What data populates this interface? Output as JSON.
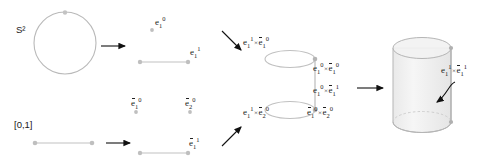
{
  "figure": {
    "domain_labels": {
      "sphere": "S²",
      "interval": "[0,1]"
    },
    "cw_left_top": {
      "vertex_cell": "e₁⁰",
      "edge_cell": "e₁¹"
    },
    "cw_left_bottom": {
      "vertex_cell_1": "ē₁⁰",
      "vertex_cell_2": "ē₂⁰",
      "edge_cell": "ē₁¹"
    },
    "product_cells": {
      "top_left": "e₁¹×ē₁⁰",
      "top_right": "e₁⁰×ē₁⁰",
      "middle_right": "e₁⁰×ē₁¹",
      "bottom_left": "e₁¹×ē₂⁰",
      "bottom_right": "ē₁⁰×ē₂⁰"
    },
    "result_cell": {
      "top_face_cell": "e₁¹×ē₁¹"
    },
    "parts": {
      "e": "e",
      "ebar": "e",
      "sub1": "1",
      "sub2": "2",
      "sup0": "0",
      "sup1": "1",
      "times": "×"
    },
    "colors": {
      "stroke_light": "#b9b9b9",
      "stroke_dot": "#9a9a9a",
      "arrow": "#111111",
      "text": "#222222",
      "cylinder_fill": "#ebebeb"
    }
  }
}
